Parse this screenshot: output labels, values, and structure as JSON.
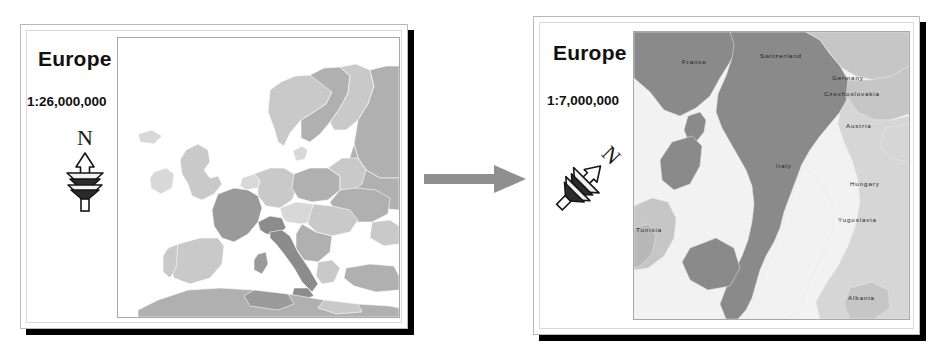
{
  "figure": {
    "type": "map-scale-comparison",
    "background": "#ffffff",
    "panel_count": 2
  },
  "panels": [
    {
      "id": "overview",
      "title": "Europe",
      "scale": "1:26,000,000",
      "north_arrow": {
        "label": "N",
        "rotation_deg": 0,
        "icon": "north-arrow-icon"
      },
      "map": {
        "extent_name": "Europe",
        "labels": [],
        "water_color": "#ffffff",
        "land_colors": [
          "#c9c9c9",
          "#b0b0b0",
          "#9a9a9a",
          "#d8d8d8",
          "#8c8c8c"
        ],
        "frame_color": "#a8a8a8"
      }
    },
    {
      "id": "detail",
      "title": "Europe",
      "scale": "1:7,000,000",
      "north_arrow": {
        "label": "N",
        "rotation_deg": 45,
        "icon": "north-arrow-icon"
      },
      "map": {
        "extent_name": "Italy and neighbours",
        "labels": [
          "France",
          "Switzerland",
          "Germany",
          "Czechoslovakia",
          "Austria",
          "Italy",
          "Hungary",
          "Yugoslavia",
          "Albania",
          "Tunisia"
        ],
        "water_color": "#f2f2f2",
        "land_colors": [
          "#8a8a8a",
          "#c6c6c6",
          "#d6d6d6"
        ],
        "frame_color": "#a8a8a8"
      }
    }
  ],
  "flow": {
    "direction": "left-to-right",
    "color": "#8f8f8f",
    "label": ""
  },
  "colors": {
    "shadow": "#000000",
    "sheet_border": "#b9b9b9",
    "sheet_inner_border": "#dadada",
    "text": "#111111",
    "arrow": "#8f8f8f"
  }
}
